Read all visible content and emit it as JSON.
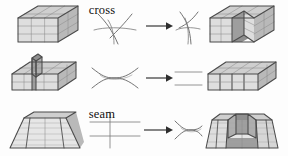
{
  "figure": {
    "name": "topological-surgery-operations",
    "background_color": "#fdfdfd",
    "width": 288,
    "height": 156,
    "rows": [
      {
        "id": "cross",
        "label": "cross",
        "left_solid": "stacked-block-3x2-grid",
        "before_diagram": "two-crossing-curves",
        "arrow": "right-arrow",
        "after_diagram": "two-tangent-curves",
        "right_solid": "block-with-notch-cut"
      },
      {
        "id": "seam",
        "label": "seam",
        "left_solid": "slab-with-vertical-fin",
        "before_diagram": "lens-shape-two-arcs",
        "arrow": "right-arrow",
        "after_diagram": "two-parallel-lines",
        "right_solid": "smooth-slab-with-ribs"
      },
      {
        "id": "blind-chord",
        "label": "blind chord",
        "left_solid": "trapezoid-layered-wedge",
        "before_diagram": "grid-two-lines-one-vertical",
        "arrow": "right-arrow",
        "after_diagram": "lens-chord-shape",
        "right_solid": "block-with-trough"
      }
    ],
    "colors": {
      "top_face": "#cfcfcf",
      "front_face": "#dedede",
      "side_face": "#b9b9b9",
      "cut_face": "#9e9e9e",
      "hard_edge": "#4a4a4a",
      "soft_edge": "#8d8d8d",
      "curve_stroke": "#5b5b5b",
      "arrow_color": "#2e2e2e",
      "label_color": "#101010"
    }
  }
}
